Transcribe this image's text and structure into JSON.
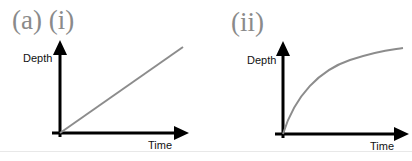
{
  "figure": {
    "panel_a_label": "(a) (i)",
    "panel_ii_label": "(ii)",
    "graphs": [
      {
        "id": "i",
        "y_label": "Depth",
        "x_label": "Time",
        "curve": "linear",
        "description": "Depth increases linearly with time"
      },
      {
        "id": "ii",
        "y_label": "Depth",
        "x_label": "Time",
        "curve": "decelerating",
        "description": "Depth increases rapidly at first then levels off with time"
      }
    ],
    "colors": {
      "axes": "#000000",
      "curve": "#8c8c8c",
      "label": "#8a8a8a"
    }
  }
}
